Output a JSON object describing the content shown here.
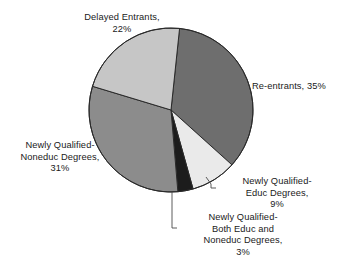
{
  "chart_data": {
    "type": "pie",
    "title": "",
    "subtitle": "",
    "xlabel": "",
    "ylabel": "",
    "legend_position": "none",
    "grid": false,
    "value_unit": "percent",
    "total": 100,
    "start_angle_deg": 6,
    "direction": "clockwise",
    "categories": [
      "Re-entrants",
      "Newly Qualified-Educ Degrees",
      "Newly Qualified-Both Educ and Noneduc Degrees",
      "Newly Qualified-Noneduc Degrees",
      "Delayed Entrants"
    ],
    "values": [
      35,
      9,
      3,
      31,
      22
    ],
    "colors": [
      "#6e6e6e",
      "#eaeaea",
      "#1c1c1c",
      "#8c8c8c",
      "#c6c6c6"
    ],
    "slices": [
      {
        "name": "re-entrants",
        "label": "Re-entrants, 35%",
        "value": 35,
        "color": "#6e6e6e",
        "leader_line": false
      },
      {
        "name": "newly-qualified-educ-degrees",
        "label": "Newly Qualified-Educ Degrees, 9%",
        "value": 9,
        "color": "#eaeaea",
        "leader_line": true
      },
      {
        "name": "newly-qualified-both-educ-and-noneduc-degrees",
        "label": "Newly Qualified-Both Educ and Noneduc Degrees, 3%",
        "value": 3,
        "color": "#1c1c1c",
        "leader_line": true
      },
      {
        "name": "newly-qualified-noneduc-degrees",
        "label": "Newly Qualified-Noneduc Degrees, 31%",
        "value": 31,
        "color": "#8c8c8c",
        "leader_line": false
      },
      {
        "name": "delayed-entrants",
        "label": "Delayed Entrants, 22%",
        "value": 22,
        "color": "#c6c6c6",
        "leader_line": false
      }
    ]
  },
  "labels": {
    "delayed_entrants": {
      "line1": "Delayed Entrants,",
      "line2": "22%"
    },
    "re_entrants": {
      "line1": "Re-entrants, 35%"
    },
    "noneduc_degrees": {
      "line1": "Newly Qualified-",
      "line2": "Noneduc Degrees,",
      "line3": "31%"
    },
    "educ_degrees": {
      "line1": "Newly Qualified-",
      "line2": "Educ Degrees,",
      "line3": "9%"
    },
    "both_degrees": {
      "line1": "Newly Qualified-",
      "line2": "Both Educ and",
      "line3": "Noneduc Degrees,",
      "line4": "3%"
    }
  },
  "style": {
    "background": "#ffffff",
    "text_color": "#1a1a1a",
    "slice_outline": "#2a2a2a",
    "leader_line_color": "#4a4a4a"
  }
}
